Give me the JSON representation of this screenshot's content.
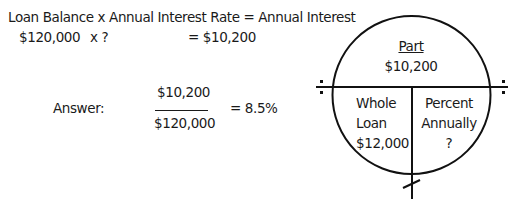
{
  "equation": {
    "formula": "Loan Balance x Annual Interest Rate = Annual Interest",
    "values_left": "$120,000",
    "values_times": "x ?",
    "values_result": "= $10,200"
  },
  "answer": {
    "label": "Answer:",
    "numerator": "$10,200",
    "denominator": "$120,000",
    "result": "= 8.5%"
  },
  "circle": {
    "top_title": "Part",
    "top_value": "$10,200",
    "bottom_left": [
      "Whole",
      "Loan",
      "$12,000"
    ],
    "bottom_right": [
      "Percent",
      "Annually",
      "?"
    ],
    "divide_icon": "÷"
  }
}
